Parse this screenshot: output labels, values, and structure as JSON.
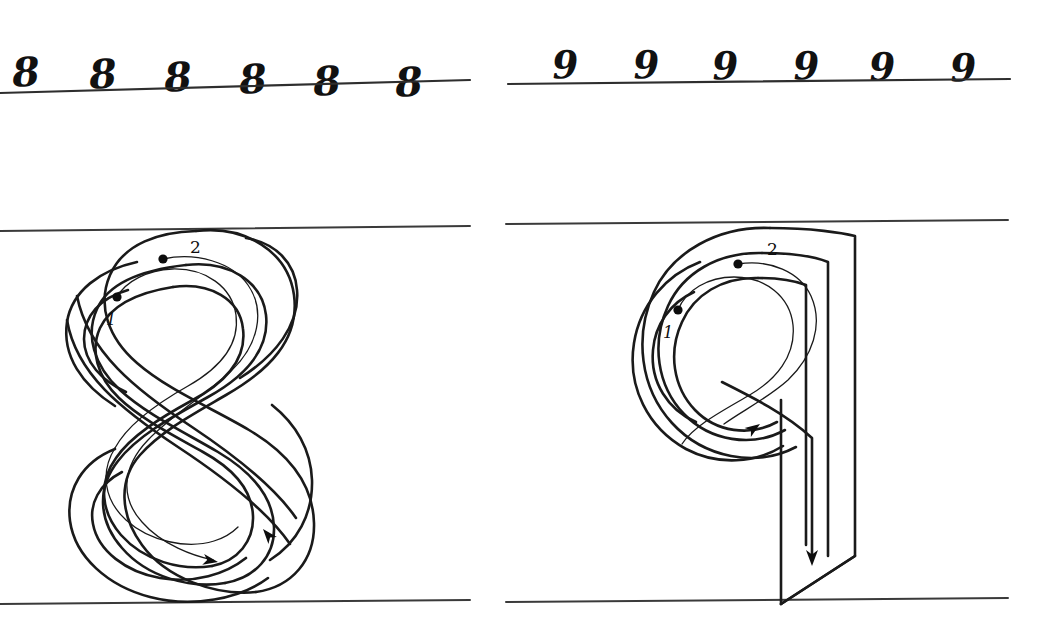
{
  "worksheet": {
    "title": "Handwriting practice worksheet: digits 8 and 9",
    "background_color": "#ffffff",
    "ink_color": "#1a1a1a",
    "rule_color": "#3a3a3a"
  },
  "practice_rows": [
    {
      "name": "eights-row",
      "digit": "8",
      "count": 6,
      "samples": [
        {
          "char": "8",
          "x": 12,
          "y": 52,
          "rotate": -4
        },
        {
          "char": "8",
          "x": 89,
          "y": 54,
          "rotate": -4
        },
        {
          "char": "8",
          "x": 164,
          "y": 57,
          "rotate": -4
        },
        {
          "char": "8",
          "x": 239,
          "y": 59,
          "rotate": -4
        },
        {
          "char": "8",
          "x": 313,
          "y": 61,
          "rotate": -4
        },
        {
          "char": "8",
          "x": 395,
          "y": 62,
          "rotate": -4
        }
      ],
      "rule": {
        "x1": 0,
        "y1": 93,
        "x2": 470,
        "y2": 80
      }
    },
    {
      "name": "nines-row",
      "digit": "9",
      "count": 6,
      "samples": [
        {
          "char": "9",
          "x": 552,
          "y": 46,
          "rotate": -3
        },
        {
          "char": "9",
          "x": 633,
          "y": 46,
          "rotate": -3
        },
        {
          "char": "9",
          "x": 712,
          "y": 47,
          "rotate": -3
        },
        {
          "char": "9",
          "x": 793,
          "y": 47,
          "rotate": -3
        },
        {
          "char": "9",
          "x": 869,
          "y": 48,
          "rotate": -3
        },
        {
          "char": "9",
          "x": 950,
          "y": 49,
          "rotate": -3
        }
      ],
      "rule": {
        "x1": 508,
        "y1": 84,
        "x2": 1010,
        "y2": 79
      }
    }
  ],
  "diagrams": [
    {
      "name": "eight-stroke-diagram",
      "digit": "8",
      "description": "Large outlined figure eight with two numbered stroke start dots and direction arrows",
      "top_rule": {
        "x1": 0,
        "y1": 231,
        "x2": 470,
        "y2": 226
      },
      "bottom_rule": {
        "x1": 0,
        "y1": 604,
        "x2": 470,
        "y2": 600
      },
      "stroke_markers": [
        {
          "label": "1",
          "dot_x": 117,
          "dot_y": 297,
          "label_x": 106,
          "label_y": 312
        },
        {
          "label": "2",
          "dot_x": 163,
          "dot_y": 259,
          "label_x": 190,
          "label_y": 239
        }
      ],
      "arrows": [
        {
          "name": "outline-arrow-down-left",
          "x": 263,
          "y": 529,
          "angle": 230
        },
        {
          "name": "guide-arrow-right",
          "x": 218,
          "y": 562,
          "angle": 10
        }
      ]
    },
    {
      "name": "nine-stroke-diagram",
      "digit": "9",
      "description": "Large outlined nine with oval loop and straight descender, two numbered stroke start dots and direction arrows",
      "top_rule": {
        "x1": 506,
        "y1": 224,
        "x2": 1008,
        "y2": 220
      },
      "bottom_rule": {
        "x1": 506,
        "y1": 602,
        "x2": 1008,
        "y2": 598
      },
      "stroke_markers": [
        {
          "label": "1",
          "dot_x": 678,
          "dot_y": 310,
          "label_x": 663,
          "label_y": 325
        },
        {
          "label": "2",
          "dot_x": 738,
          "dot_y": 264,
          "label_x": 767,
          "label_y": 241
        },
        {
          "label": "descender",
          "dot_x": 0,
          "dot_y": 0,
          "label_x": 0,
          "label_y": 0
        }
      ],
      "arrows": [
        {
          "name": "loop-arrow-up-right",
          "x": 760,
          "y": 424,
          "angle": 325
        },
        {
          "name": "descender-arrow-down",
          "x": 812,
          "y": 566,
          "angle": 90
        }
      ]
    }
  ]
}
